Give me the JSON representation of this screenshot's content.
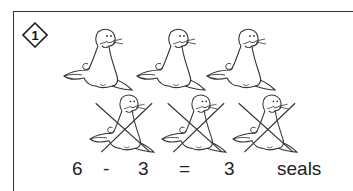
{
  "problem": {
    "number": "1",
    "total_seals": 6,
    "crossed_seals": 3
  },
  "equation": {
    "minuend": "6",
    "operator": "-",
    "subtrahend": "3",
    "equals": "=",
    "result": "3",
    "unit": "seals"
  },
  "icons": {
    "badge": "diamond-number-badge",
    "seal": "seal-illustration",
    "cross": "x-cross-mark"
  },
  "colors": {
    "line": "#333333",
    "background": "#ffffff"
  }
}
